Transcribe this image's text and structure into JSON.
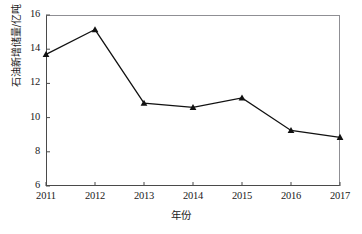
{
  "chart_data": {
    "type": "line",
    "title": "",
    "subtitle": "",
    "xlabel": "年份",
    "ylabel": "石油新增储量/亿吨",
    "categories": [
      "2011",
      "2012",
      "2013",
      "2014",
      "2015",
      "2016",
      "2017"
    ],
    "values": [
      13.7,
      15.15,
      10.85,
      10.6,
      11.15,
      9.25,
      8.85
    ],
    "series": [
      {
        "name": "石油新增储量",
        "values": [
          13.7,
          15.15,
          10.85,
          10.6,
          11.15,
          9.25,
          8.85
        ]
      }
    ],
    "x": [
      2011,
      2012,
      2013,
      2014,
      2015,
      2016,
      2017
    ],
    "ylim": [
      6,
      16
    ],
    "xlim": [
      2011,
      2017
    ],
    "y_ticks": [
      6,
      8,
      10,
      12,
      14,
      16
    ],
    "y_tick_labels": [
      "6",
      "8",
      "10",
      "12",
      "14",
      "16"
    ],
    "x_ticks": [
      2011,
      2012,
      2013,
      2014,
      2015,
      2016,
      2017
    ],
    "x_tick_labels": [
      "2011",
      "2012",
      "2013",
      "2014",
      "2015",
      "2016",
      "2017"
    ],
    "grid": false,
    "legend": false,
    "legend_position": "none",
    "marker": "triangle",
    "marker_color": "#111111",
    "line_color": "#111111",
    "line_width": 1.3,
    "annotations": []
  },
  "axes": {
    "y_title": "石油新增储量/亿吨",
    "x_title": "年份"
  }
}
